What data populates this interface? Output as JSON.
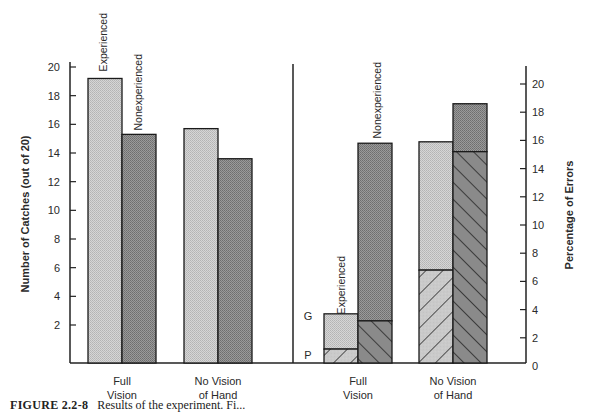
{
  "chart_data": [
    {
      "type": "bar",
      "title": "",
      "xlabel": "",
      "ylabel": "Number of Catches (out of 20)",
      "ylim": [
        0,
        20
      ],
      "yticks": [
        2,
        4,
        6,
        8,
        10,
        12,
        14,
        16,
        18,
        20
      ],
      "categories": [
        "Full Vision",
        "No Vision of Hand"
      ],
      "category_lines": [
        [
          "Full",
          "Vision"
        ],
        [
          "No Vision",
          "of Hand"
        ]
      ],
      "series": [
        {
          "name": "Experienced",
          "values": [
            19.2,
            15.7
          ],
          "color": "#c9c9c9"
        },
        {
          "name": "Nonexperienced",
          "values": [
            15.3,
            13.6
          ],
          "color": "#8c8c8c"
        }
      ],
      "annotations": [
        "Experienced",
        "Nonexperienced"
      ],
      "grid": false,
      "legend": "none (rotated labels above first bar pair)"
    },
    {
      "type": "bar",
      "stacked": true,
      "title": "",
      "xlabel": "",
      "ylabel": "Percentage of Errors",
      "ylim": [
        0,
        21
      ],
      "yticks": [
        0,
        2,
        4,
        6,
        8,
        10,
        12,
        14,
        16,
        18,
        20
      ],
      "categories": [
        "Full Vision",
        "No Vision of Hand"
      ],
      "category_lines": [
        [
          "Full",
          "Vision"
        ],
        [
          "No Vision",
          "of Hand"
        ]
      ],
      "segment_labels": {
        "P": "hatched lower segment",
        "G": "stippled upper segment"
      },
      "series": [
        {
          "name": "Experienced",
          "color": "#c9c9c9",
          "P": [
            1.2,
            6.8
          ],
          "G": [
            2.5,
            9.1
          ],
          "totals": [
            3.7,
            15.9
          ]
        },
        {
          "name": "Nonexperienced",
          "color": "#8c8c8c",
          "P": [
            3.2,
            15.2
          ],
          "G": [
            12.6,
            3.4
          ],
          "totals": [
            15.8,
            18.6
          ]
        }
      ],
      "annotations": [
        "Experienced",
        "Nonexperienced",
        "G",
        "P"
      ],
      "grid": false,
      "legend": "none (rotated labels above bars, G/P letters beside first stack)"
    }
  ],
  "caption": {
    "figure_number": "FIGURE 2.2-8",
    "text": "Results of the experiment. Fi..."
  }
}
